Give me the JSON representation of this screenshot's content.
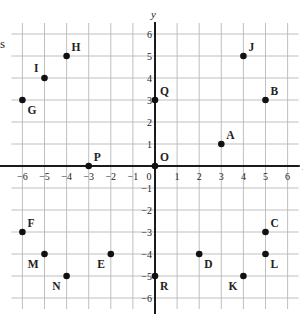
{
  "chart_data": {
    "type": "scatter",
    "title": "",
    "xlabel": "x",
    "ylabel": "y",
    "xlim": [
      -6,
      6
    ],
    "ylim": [
      -6,
      6
    ],
    "grid": true,
    "x_ticks": [
      -6,
      -5,
      -4,
      -3,
      -2,
      -1,
      0,
      1,
      2,
      3,
      4,
      5,
      6
    ],
    "y_ticks": [
      6,
      5,
      4,
      3,
      2,
      1,
      -1,
      -2,
      -3,
      -4,
      -5,
      -6
    ],
    "points": [
      {
        "label": "A",
        "x": 3,
        "y": 1,
        "label_pos": "ne"
      },
      {
        "label": "B",
        "x": 5,
        "y": 3,
        "label_pos": "ne"
      },
      {
        "label": "C",
        "x": 5,
        "y": -3,
        "label_pos": "ne"
      },
      {
        "label": "D",
        "x": 2,
        "y": -4,
        "label_pos": "se"
      },
      {
        "label": "E",
        "x": -2,
        "y": -4,
        "label_pos": "sw"
      },
      {
        "label": "F",
        "x": -6,
        "y": -3,
        "label_pos": "ne"
      },
      {
        "label": "G",
        "x": -6,
        "y": 3,
        "label_pos": "se"
      },
      {
        "label": "H",
        "x": -4,
        "y": 5,
        "label_pos": "ne"
      },
      {
        "label": "I",
        "x": -5,
        "y": 4,
        "label_pos": "nw"
      },
      {
        "label": "J",
        "x": 4,
        "y": 5,
        "label_pos": "ne"
      },
      {
        "label": "K",
        "x": 4,
        "y": -5,
        "label_pos": "sw"
      },
      {
        "label": "L",
        "x": 5,
        "y": -4,
        "label_pos": "se"
      },
      {
        "label": "M",
        "x": -5,
        "y": -4,
        "label_pos": "sw"
      },
      {
        "label": "N",
        "x": -4,
        "y": -5,
        "label_pos": "sw"
      },
      {
        "label": "O",
        "x": 0,
        "y": 0,
        "label_pos": "ne"
      },
      {
        "label": "P",
        "x": -3,
        "y": 0,
        "label_pos": "ne"
      },
      {
        "label": "Q",
        "x": 0,
        "y": 3,
        "label_pos": "ne"
      },
      {
        "label": "R",
        "x": 0,
        "y": -5,
        "label_pos": "se"
      }
    ]
  },
  "page": {
    "edge_char": "s"
  },
  "colors": {
    "grid": "#b8b8b8",
    "axis": "#1a1a1a",
    "point": "#111111",
    "text": "#222222"
  }
}
